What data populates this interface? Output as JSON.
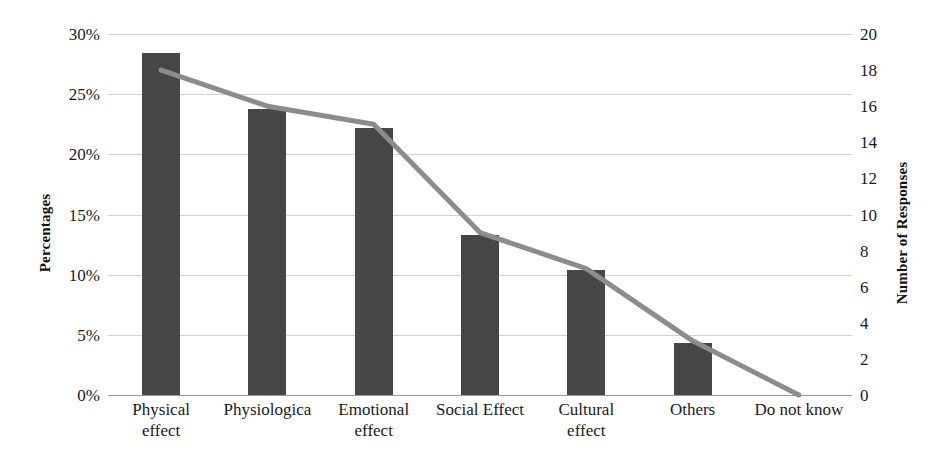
{
  "chart_data": {
    "type": "bar",
    "title": "",
    "subtitle": "",
    "xlabel": "",
    "ylabel": "Percentages",
    "y2label": "Number of Responses",
    "categories": [
      "Physical effect",
      "Physiologica",
      "Emotional effect",
      "Social Effect",
      "Cultural effect",
      "Others",
      "Do not know"
    ],
    "category_lines": [
      [
        "Physical",
        "effect"
      ],
      [
        "Physiologica"
      ],
      [
        "Emotional",
        "effect"
      ],
      [
        "Social Effect"
      ],
      [
        "Cultural",
        "effect"
      ],
      [
        "Others"
      ],
      [
        "Do not know"
      ]
    ],
    "series": [
      {
        "name": "Percentages",
        "type": "bar",
        "axis": "left",
        "values": [
          28.4,
          23.8,
          22.2,
          13.3,
          10.4,
          4.3,
          0
        ],
        "value_labels": [
          "28%",
          "24%",
          "22%",
          "13%",
          "10%",
          "4%",
          "0%"
        ],
        "color": "#464646"
      },
      {
        "name": "Number of Responses",
        "type": "line",
        "axis": "right",
        "values": [
          18,
          16,
          15,
          9,
          7,
          3,
          0
        ],
        "color": "#8c8c8c"
      }
    ],
    "ylim": [
      0,
      30
    ],
    "yticks": [
      0,
      5,
      10,
      15,
      20,
      25,
      30
    ],
    "ytick_labels": [
      "0%",
      "5%",
      "10%",
      "15%",
      "20%",
      "25%",
      "30%"
    ],
    "y2lim": [
      0,
      20
    ],
    "y2ticks": [
      0,
      2,
      4,
      6,
      8,
      10,
      12,
      14,
      16,
      18,
      20
    ],
    "y2tick_labels": [
      "0",
      "2",
      "4",
      "6",
      "8",
      "10",
      "12",
      "14",
      "16",
      "18",
      "20"
    ],
    "grid": true,
    "grid_axis": "y-left",
    "legend": false,
    "legend_position": "none",
    "background": "#ffffff",
    "gridline_color": "#d2d2d2"
  }
}
